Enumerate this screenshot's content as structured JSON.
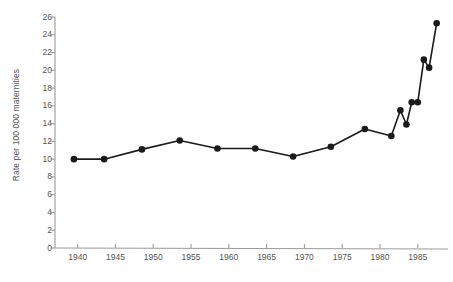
{
  "chart_data": {
    "type": "line",
    "title": "",
    "subtitle": "",
    "xlabel": "",
    "ylabel": "Rate per 100 000 maternities",
    "xlim": [
      1937,
      1989
    ],
    "ylim": [
      0,
      26
    ],
    "ytick_values": [
      0,
      2,
      4,
      6,
      8,
      10,
      12,
      14,
      16,
      18,
      20,
      22,
      24,
      26
    ],
    "ytick_labels": [
      "0",
      "2",
      "4",
      "6",
      "8",
      "10",
      "12",
      "14",
      "16",
      "18",
      "20",
      "22",
      "24",
      "26"
    ],
    "xtick_values": [
      1940,
      1945,
      1950,
      1955,
      1960,
      1965,
      1970,
      1975,
      1980,
      1985
    ],
    "xtick_labels": [
      "1940",
      "1945",
      "1950",
      "1955",
      "1960",
      "1965",
      "1970",
      "1975",
      "1980",
      "1985"
    ],
    "grid": false,
    "legend": false,
    "legend_position": "none",
    "marker": "filled-circle",
    "line_color": "#1a1a1a",
    "marker_color": "#1a1a1a",
    "axis_color": "#9a9a9a",
    "series": [
      {
        "name": "Maternal mortality rate",
        "x": [
          1939.5,
          1943.5,
          1948.5,
          1953.5,
          1958.5,
          1963.5,
          1968.5,
          1973.5,
          1978.0,
          1981.5,
          1982.7,
          1983.5,
          1984.2,
          1985.0,
          1985.8,
          1986.5,
          1987.5
        ],
        "values": [
          10.0,
          10.0,
          11.1,
          12.1,
          11.2,
          11.2,
          10.3,
          11.4,
          13.4,
          12.6,
          15.5,
          13.9,
          16.4,
          16.4,
          21.2,
          20.3,
          25.3
        ]
      }
    ]
  },
  "caption": {
    "text": ""
  }
}
